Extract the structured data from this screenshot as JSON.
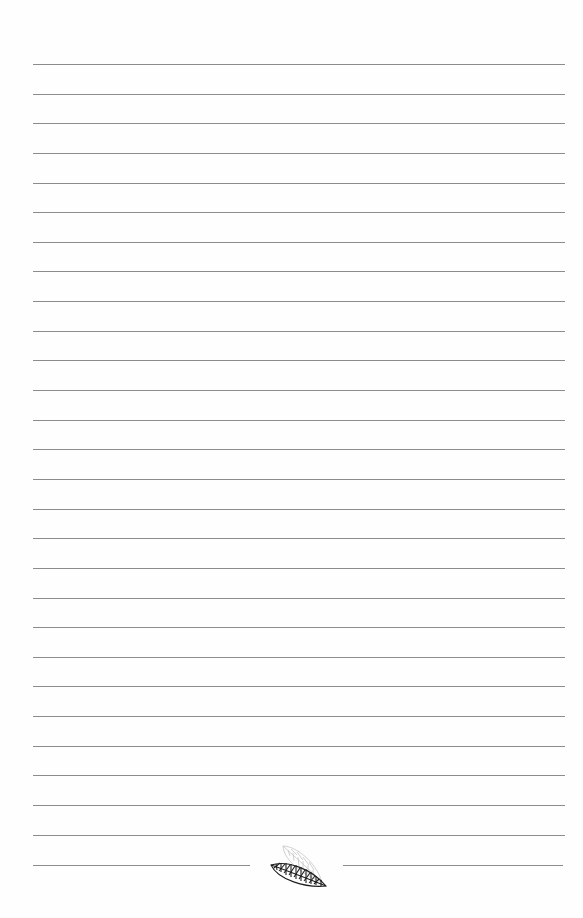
{
  "page": {
    "type": "ruled-notebook-page",
    "background_color": "#fefefe",
    "line_color": "#8c8c8c",
    "line_left": 33,
    "line_right": 565,
    "first_line_y": 64,
    "line_spacing": 29.64,
    "full_line_count": 27
  },
  "footer": {
    "split_line_y": 865,
    "left_segment": {
      "x1": 33,
      "x2": 250
    },
    "right_segment": {
      "x1": 343,
      "x2": 563
    },
    "ornament": {
      "icon": "leaf-ornament-icon",
      "leaves": [
        {
          "name": "back-leaf",
          "color": "#c8c8c8"
        },
        {
          "name": "front-leaf",
          "color": "#222222"
        }
      ]
    }
  }
}
